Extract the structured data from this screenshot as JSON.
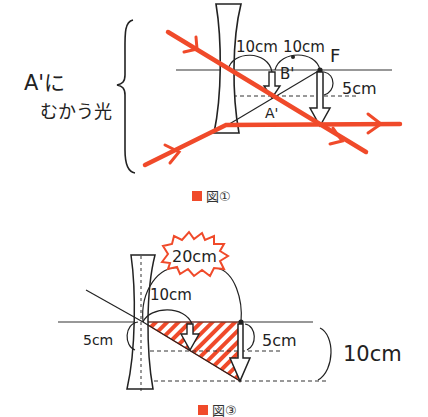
{
  "colors": {
    "ray": "#f04a2a",
    "ink": "#222222",
    "hatch": "#f04a2a",
    "caption_square": "#f04a2a"
  },
  "figure1": {
    "side_label_line1": "A'に",
    "side_label_line2": "むかう光",
    "dist_label_1": "10cm",
    "dist_label_2": "10cm",
    "focal_label": "F",
    "point_b": "B'",
    "point_a": "A'",
    "height_label": "5cm",
    "caption": "図①"
  },
  "figure3": {
    "callout_label": "20cm",
    "dist_label": "10cm",
    "left_height_label": "5cm",
    "right_height_label": "5cm",
    "total_height_label": "10cm",
    "caption": "図③"
  }
}
